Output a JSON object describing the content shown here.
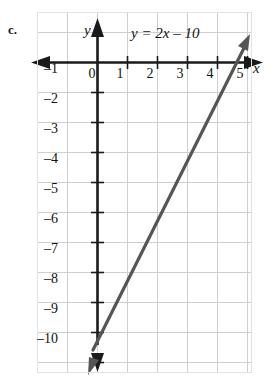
{
  "figure": {
    "part_label": "c.",
    "equation": "y = 2x – 10",
    "axis_names": {
      "x": "x",
      "y": "y"
    }
  },
  "chart_data": {
    "type": "line",
    "title": "",
    "subtitle": "",
    "equation": "y = 2x - 10",
    "slope": 2,
    "y_intercept": -10,
    "x_intercept": 5,
    "xlabel": "x",
    "ylabel": "y",
    "xlim": [
      -1,
      6
    ],
    "ylim": [
      -11,
      1
    ],
    "xticks": [
      0,
      1,
      2,
      3,
      4,
      5
    ],
    "xtick_labels": [
      "0",
      "1",
      "2",
      "3",
      "4",
      "5"
    ],
    "yticks": [
      -1,
      -2,
      -3,
      -4,
      -5,
      -6,
      -7,
      -8,
      -9,
      -10
    ],
    "ytick_labels": [
      "–1",
      "–2",
      "–3",
      "–4",
      "–5",
      "–6",
      "–7",
      "–8",
      "–9",
      "–10"
    ],
    "grid": true,
    "legend": "none",
    "series": [
      {
        "name": "y = 2x - 10",
        "points": [
          [
            0,
            -10
          ],
          [
            5,
            0
          ]
        ],
        "arrows": "both",
        "color": "#555555"
      }
    ],
    "annotations": [
      {
        "text": "y = 2x – 10",
        "x": 1.3,
        "y": 0.85
      }
    ],
    "colors": {
      "line": "#555555",
      "axis": "#1a1a1a",
      "grid": "#cfcfcf",
      "text": "#111111",
      "background": "#ffffff"
    }
  },
  "ticks": {
    "x": [
      {
        "label": "0",
        "px": 92,
        "py": 66
      },
      {
        "label": "1",
        "px": 120,
        "py": 66
      },
      {
        "label": "2",
        "px": 150,
        "py": 66
      },
      {
        "label": "3",
        "px": 180,
        "py": 66
      },
      {
        "label": "4",
        "px": 210,
        "py": 66
      },
      {
        "label": "5",
        "px": 240,
        "py": 66
      }
    ],
    "y": [
      {
        "label": "–1",
        "px": 58,
        "py": 70
      },
      {
        "label": "–2",
        "px": 58,
        "py": 100
      },
      {
        "label": "–3",
        "px": 58,
        "py": 130
      },
      {
        "label": "–4",
        "px": 58,
        "py": 160
      },
      {
        "label": "–5",
        "px": 58,
        "py": 190
      },
      {
        "label": "–6",
        "px": 58,
        "py": 220
      },
      {
        "label": "–7",
        "px": 58,
        "py": 250
      },
      {
        "label": "–8",
        "px": 58,
        "py": 280
      },
      {
        "label": "–9",
        "px": 58,
        "py": 310
      },
      {
        "label": "–10",
        "px": 58,
        "py": 340
      }
    ]
  }
}
